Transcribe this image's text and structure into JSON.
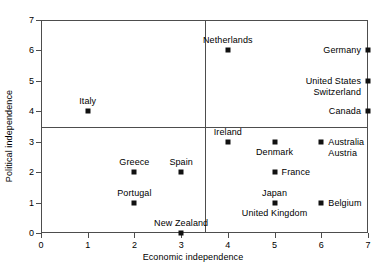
{
  "chart_data": {
    "type": "scatter",
    "title": "",
    "xlabel": "Economic independence",
    "ylabel": "Political independence",
    "xlim": [
      0,
      7
    ],
    "ylim": [
      0,
      7
    ],
    "xticks": [
      "0",
      "1",
      "2",
      "3",
      "4",
      "5",
      "6",
      "7"
    ],
    "yticks": [
      "0",
      "1",
      "2",
      "3",
      "4",
      "5",
      "6",
      "7"
    ],
    "grid": false,
    "legend": "none",
    "reference_lines": {
      "vertical_x": 3.5,
      "horizontal_y": 3.5
    },
    "points": [
      {
        "label": "Italy",
        "x": 1,
        "y": 4,
        "label_pos": "above"
      },
      {
        "label": "Netherlands",
        "x": 4,
        "y": 6,
        "label_pos": "above"
      },
      {
        "label": "Germany",
        "x": 7,
        "y": 6,
        "label_pos": "left"
      },
      {
        "label": "United States",
        "x": 7,
        "y": 5,
        "label_pos": "left"
      },
      {
        "label": "Switzerland",
        "x": 7,
        "y": 5,
        "label_pos": "left-lower"
      },
      {
        "label": "Canada",
        "x": 7,
        "y": 4,
        "label_pos": "left"
      },
      {
        "label": "Ireland",
        "x": 4,
        "y": 3,
        "label_pos": "above"
      },
      {
        "label": "Denmark",
        "x": 5,
        "y": 3,
        "label_pos": "below"
      },
      {
        "label": "Australia",
        "x": 6,
        "y": 3,
        "label_pos": "right"
      },
      {
        "label": "Austria",
        "x": 6,
        "y": 3,
        "label_pos": "right-lower"
      },
      {
        "label": "Greece",
        "x": 2,
        "y": 2,
        "label_pos": "above"
      },
      {
        "label": "Spain",
        "x": 3,
        "y": 2,
        "label_pos": "above"
      },
      {
        "label": "France",
        "x": 5,
        "y": 2,
        "label_pos": "right"
      },
      {
        "label": "Portugal",
        "x": 2,
        "y": 1,
        "label_pos": "above"
      },
      {
        "label": "Japan",
        "x": 5,
        "y": 1,
        "label_pos": "above"
      },
      {
        "label": "United Kingdom",
        "x": 5,
        "y": 1,
        "label_pos": "below"
      },
      {
        "label": "Belgium",
        "x": 6,
        "y": 1,
        "label_pos": "right"
      },
      {
        "label": "New Zealand",
        "x": 3,
        "y": 0,
        "label_pos": "above"
      }
    ],
    "marker_color": "#111111",
    "frame_color": "#4d4d4d"
  }
}
